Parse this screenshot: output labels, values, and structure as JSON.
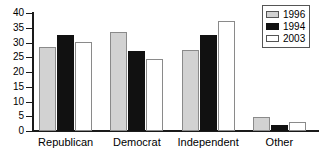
{
  "chart_data": {
    "type": "bar",
    "title": "",
    "subtitle": "",
    "xlabel": "",
    "ylabel": "",
    "ylim": [
      0,
      40
    ],
    "yticks": [
      0,
      5,
      10,
      15,
      20,
      25,
      30,
      35,
      40
    ],
    "ytick_labels": [
      "0",
      "5",
      "10",
      "15",
      "20",
      "25",
      "30",
      "35",
      "40"
    ],
    "grid": false,
    "legend_position": "top-right",
    "categories": [
      "Republican",
      "Democrat",
      "Independent",
      "Other"
    ],
    "series": [
      {
        "name": "1996",
        "color": "#d2d2d2",
        "values": [
          28.5,
          33.7,
          27.6,
          4.8
        ]
      },
      {
        "name": "1994",
        "color": "#111111",
        "values": [
          32.5,
          27.0,
          32.7,
          2.0
        ]
      },
      {
        "name": "2003",
        "color": "#ffffff",
        "values": [
          30.3,
          24.3,
          37.3,
          3.2
        ]
      }
    ]
  },
  "legend": {
    "entries": [
      {
        "label": "1996",
        "swatch": "legend-swatch-1996"
      },
      {
        "label": "1994",
        "swatch": "legend-swatch-1994"
      },
      {
        "label": "2003",
        "swatch": "legend-swatch-2003"
      }
    ]
  }
}
